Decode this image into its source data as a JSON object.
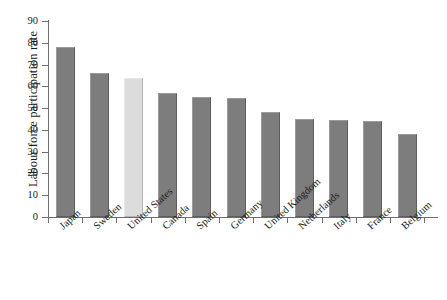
{
  "chart_data": {
    "type": "bar",
    "title": "",
    "subtitle": "",
    "xlabel": "",
    "ylabel": "Labour force participation rate",
    "ylim": [
      0,
      90
    ],
    "y_ticks": [
      0,
      10,
      20,
      30,
      40,
      50,
      60,
      70,
      80,
      90
    ],
    "grid": false,
    "legend": null,
    "categories": [
      "Japan",
      "Sweden",
      "United States",
      "Canada",
      "Spain",
      "Germany",
      "United Kingdom",
      "Netherlands",
      "Italy",
      "France",
      "Belgium"
    ],
    "values": [
      78,
      66,
      64,
      57,
      55,
      54.5,
      48,
      45,
      44.5,
      44,
      38
    ],
    "bar_colors": [
      "#7d7d7d",
      "#7d7d7d",
      "#dcdcdc",
      "#7d7d7d",
      "#7d7d7d",
      "#7d7d7d",
      "#7d7d7d",
      "#7d7d7d",
      "#7d7d7d",
      "#7d7d7d",
      "#7d7d7d"
    ],
    "highlighted_category": "United States",
    "colors": {
      "bar_default": "#7d7d7d",
      "bar_highlight": "#dcdcdc",
      "axis": "#6e6e6e",
      "text": "#1c1c1c",
      "background": "#ffffff"
    }
  }
}
